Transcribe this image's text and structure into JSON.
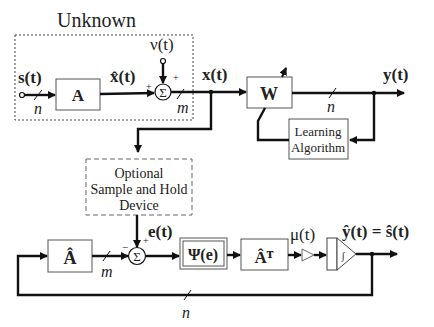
{
  "title": "Unknown",
  "signals": {
    "source": "s(t)",
    "mixed_clean": "x̂(t)",
    "noise": "ν(t)",
    "observed": "x(t)",
    "output": "y(t)",
    "error": "e(t)",
    "step": "μ(t)",
    "estimate": "ŷ(t) = ŝ(t)"
  },
  "blocks": {
    "mixing": "A",
    "separating": "W",
    "learning_line1": "Learning",
    "learning_line2": "Algorithm",
    "sample_line1": "Optional",
    "sample_line2": "Sample and Hold",
    "sample_line3": "Device",
    "estimate_mixing": "Â",
    "nonlinearity": "Ψ(e)",
    "estimate_transpose": "Âᵀ",
    "sum_symbol": "Σ",
    "integrator_symbol": "∫"
  },
  "dimensions": {
    "n_source": "n",
    "m_sensor": "m",
    "n_output": "n",
    "m_error": "m",
    "n_feedback": "n"
  },
  "signs": {
    "plus": "+",
    "minus": "−"
  }
}
